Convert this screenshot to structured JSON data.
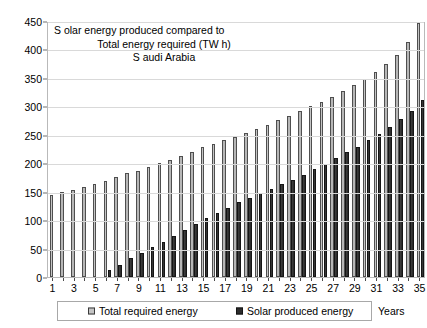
{
  "chart_data": {
    "type": "bar",
    "title_lines": [
      "S olar energy produced compared to",
      "Total energy required (TW h)",
      "S audi Arabia"
    ],
    "xlabel": "Years",
    "ylabel": "",
    "ylim": [
      0,
      450
    ],
    "ytick_step": 50,
    "yticks": [
      0,
      50,
      100,
      150,
      200,
      250,
      300,
      350,
      400,
      450
    ],
    "ytick_labels": [
      "0",
      "50",
      "100",
      "150",
      "200",
      "250",
      "300",
      "350",
      "400",
      "450"
    ],
    "grid": true,
    "legend_position": "bottom",
    "categories": [
      1,
      2,
      3,
      4,
      5,
      6,
      7,
      8,
      9,
      10,
      11,
      12,
      13,
      14,
      15,
      16,
      17,
      18,
      19,
      20,
      21,
      22,
      23,
      24,
      25,
      26,
      27,
      28,
      29,
      30,
      31,
      32,
      33,
      34,
      35
    ],
    "xtick_labels": [
      "1",
      "3",
      "5",
      "7",
      "9",
      "11",
      "13",
      "15",
      "17",
      "19",
      "21",
      "23",
      "25",
      "27",
      "29",
      "31",
      "33",
      "35"
    ],
    "series": [
      {
        "name": "Total required energy",
        "color": "#c0c0c0",
        "values": [
          145,
          149,
          153,
          159,
          164,
          169,
          175,
          182,
          187,
          194,
          201,
          205,
          212,
          220,
          228,
          234,
          241,
          247,
          253,
          260,
          268,
          276,
          283,
          291,
          300,
          308,
          317,
          327,
          337,
          348,
          360,
          374,
          390,
          413,
          447
        ]
      },
      {
        "name": "Solar produced energy",
        "color": "#2d2d2d",
        "values": [
          0,
          0,
          0,
          0,
          0,
          12,
          22,
          33,
          42,
          52,
          62,
          72,
          82,
          93,
          103,
          113,
          122,
          131,
          139,
          147,
          155,
          163,
          171,
          180,
          190,
          199,
          209,
          219,
          229,
          240,
          252,
          264,
          277,
          292,
          311
        ]
      }
    ]
  },
  "legend": {
    "entries": [
      {
        "label": "Total required energy"
      },
      {
        "label": "Solar produced energy"
      }
    ]
  },
  "axis": {
    "x_label": "Years"
  }
}
